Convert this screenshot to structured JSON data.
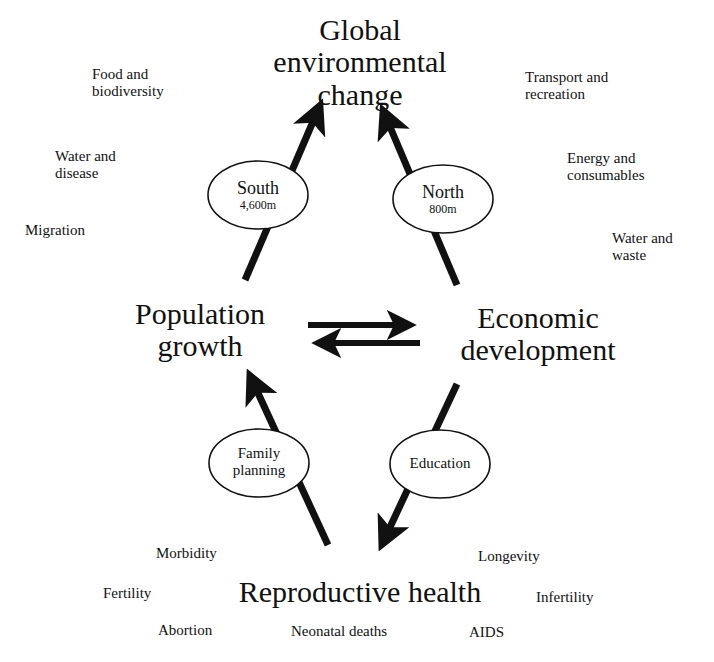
{
  "diagram": {
    "nodes": {
      "top": {
        "line1": "Global",
        "line2": "environmental",
        "line3": "change"
      },
      "left": {
        "line1": "Population",
        "line2": "growth"
      },
      "right": {
        "line1": "Economic",
        "line2": "development"
      },
      "bottom": {
        "line1": "Reproductive health"
      }
    },
    "ellipses": {
      "south": {
        "title": "South",
        "sub": "4,600m"
      },
      "north": {
        "title": "North",
        "sub": "800m"
      },
      "family_planning": {
        "line1": "Family",
        "line2": "planning"
      },
      "education": {
        "line1": "Education"
      }
    },
    "left_issues": [
      {
        "line1": "Food and",
        "line2": "biodiversity"
      },
      {
        "line1": "Water and",
        "line2": "disease"
      },
      {
        "line1": "Migration"
      }
    ],
    "right_issues": [
      {
        "line1": "Transport and",
        "line2": "recreation"
      },
      {
        "line1": "Energy and",
        "line2": "consumables"
      },
      {
        "line1": "Water and",
        "line2": "waste"
      }
    ],
    "health_issues": {
      "morbidity": "Morbidity",
      "longevity": "Longevity",
      "fertility": "Fertility",
      "infertility": "Infertility",
      "abortion": "Abortion",
      "neonatal_deaths": "Neonatal deaths",
      "aids": "AIDS"
    },
    "colors": {
      "ink": "#111111",
      "background": "#ffffff"
    }
  }
}
